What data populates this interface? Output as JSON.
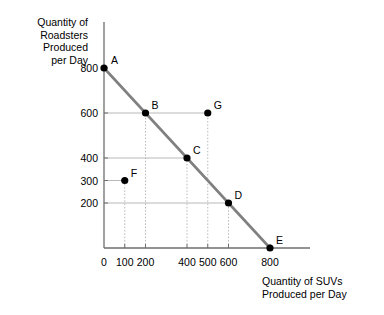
{
  "chart_data": {
    "type": "line",
    "title": "",
    "xlabel": "Quantity of SUVs\nProduced per Day",
    "ylabel": "Quantity of\nRoadsters\nProduced\nper Day",
    "xlim": [
      0,
      900
    ],
    "ylim": [
      0,
      900
    ],
    "grid": true,
    "legend": "none",
    "x_ticks": [
      {
        "value": 0,
        "label": "0"
      },
      {
        "value": 100,
        "label": "100"
      },
      {
        "value": 200,
        "label": "200"
      },
      {
        "value": 400,
        "label": "400"
      },
      {
        "value": 500,
        "label": "500"
      },
      {
        "value": 600,
        "label": "600"
      },
      {
        "value": 800,
        "label": "800"
      }
    ],
    "y_ticks": [
      {
        "value": 200,
        "label": "200"
      },
      {
        "value": 300,
        "label": "300"
      },
      {
        "value": 400,
        "label": "400"
      },
      {
        "value": 600,
        "label": "600"
      },
      {
        "value": 800,
        "label": "800"
      }
    ],
    "series": [
      {
        "name": "production-possibilities-frontier",
        "type": "line",
        "color": "#808080",
        "x": [
          0,
          800
        ],
        "y": [
          800,
          0
        ]
      }
    ],
    "points": [
      {
        "label": "A",
        "x": 0,
        "y": 800,
        "on_frontier": true,
        "label_dx": 7,
        "label_dy": -9
      },
      {
        "label": "B",
        "x": 200,
        "y": 600,
        "on_frontier": true,
        "label_dx": 6,
        "label_dy": -9
      },
      {
        "label": "C",
        "x": 400,
        "y": 400,
        "on_frontier": true,
        "label_dx": 6,
        "label_dy": -9
      },
      {
        "label": "D",
        "x": 600,
        "y": 200,
        "on_frontier": true,
        "label_dx": 6,
        "label_dy": -9
      },
      {
        "label": "E",
        "x": 800,
        "y": 0,
        "on_frontier": true,
        "label_dx": 6,
        "label_dy": -9
      },
      {
        "label": "F",
        "x": 100,
        "y": 300,
        "on_frontier": false,
        "label_dx": 6,
        "label_dy": -9
      },
      {
        "label": "G",
        "x": 500,
        "y": 600,
        "on_frontier": false,
        "label_dx": 6,
        "label_dy": -9
      }
    ],
    "guide_lines": {
      "horizontal_from_y_axis": [
        {
          "to_point": "B",
          "y": 600,
          "x_end": 500
        },
        {
          "to_point": "C",
          "y": 400,
          "x_end": 400
        },
        {
          "to_point": "D",
          "y": 200,
          "x_end": 600
        },
        {
          "to_point": "F",
          "y": 300,
          "x_end": 100
        }
      ],
      "vertical_to_x_axis": [
        {
          "from_point": "B",
          "x": 200
        },
        {
          "from_point": "C",
          "x": 400
        },
        {
          "from_point": "D",
          "x": 600
        },
        {
          "from_point": "F",
          "x": 100
        },
        {
          "from_point": "G",
          "x": 500
        }
      ]
    },
    "colors": {
      "frontier": "#808080",
      "point": "#000000",
      "grid": "#b8b8b8",
      "axis": "#6e6e6e",
      "text": "#000000"
    }
  }
}
